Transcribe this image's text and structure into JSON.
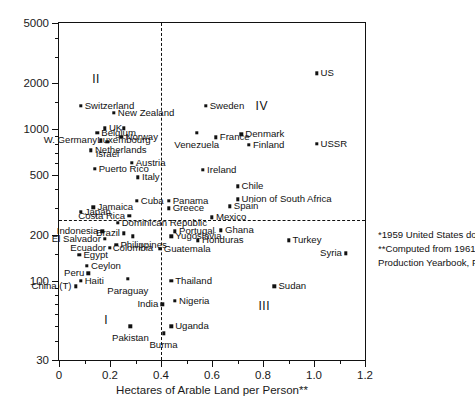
{
  "chart_data": {
    "type": "scatter",
    "title": "",
    "xlabel": "Hectares of Arable Land per Person**",
    "ylabel": "Income per Person*",
    "xlim": [
      0,
      1.2
    ],
    "ylim": [
      30,
      5000
    ],
    "yscale": "log",
    "xscale": "linear",
    "grid": false,
    "legend": null,
    "xticks": [
      "0",
      "0.2",
      "0.4",
      "0.6",
      "0.8",
      "1.0",
      "1.2"
    ],
    "xtick_values": [
      0,
      0.2,
      0.4,
      0.6,
      0.8,
      1.0,
      1.2
    ],
    "yticks": [
      "5000",
      "2000",
      "1000",
      "500",
      "200",
      "100",
      "30"
    ],
    "ytick_values": [
      5000,
      2000,
      1000,
      500,
      200,
      100,
      30
    ],
    "reference_lines": [
      {
        "orientation": "vertical",
        "value": 0.4,
        "style": "dashed"
      },
      {
        "orientation": "horizontal",
        "value": 250,
        "style": "dashed"
      }
    ],
    "quadrant_labels": [
      {
        "label": "I",
        "x": 0.185,
        "y": 55
      },
      {
        "label": "II",
        "x": 0.145,
        "y": 2150
      },
      {
        "label": "III",
        "x": 0.805,
        "y": 68
      },
      {
        "label": "IV",
        "x": 0.795,
        "y": 1420
      }
    ],
    "annotations": [
      "*1959 United States dollars",
      "**Computed from 1961",
      "Production Yearbook, FAO"
    ],
    "points": [
      {
        "name": "US",
        "x": 1.01,
        "y": 2330,
        "side": "r"
      },
      {
        "name": "USSR",
        "x": 1.01,
        "y": 800,
        "side": "r"
      },
      {
        "name": "Switzerland",
        "x": 0.085,
        "y": 1420,
        "side": "r"
      },
      {
        "name": "New Zealand",
        "x": 0.215,
        "y": 1275,
        "side": "r"
      },
      {
        "name": "Sweden",
        "x": 0.575,
        "y": 1420,
        "side": "r"
      },
      {
        "name": "UK",
        "x": 0.18,
        "y": 1010,
        "side": "r"
      },
      {
        "name": "Luxembourg",
        "x": 0.255,
        "y": 1010,
        "side": "cb"
      },
      {
        "name": "Belgium",
        "x": 0.15,
        "y": 940,
        "side": "r"
      },
      {
        "name": "Venezuela",
        "x": 0.54,
        "y": 940,
        "side": "cb"
      },
      {
        "name": "Denmark",
        "x": 0.715,
        "y": 925,
        "side": "r"
      },
      {
        "name": "Norway",
        "x": 0.245,
        "y": 885,
        "side": "r"
      },
      {
        "name": "W. Germany",
        "x": 0.165,
        "y": 845,
        "side": "l"
      },
      {
        "name": "France",
        "x": 0.615,
        "y": 880,
        "side": "r"
      },
      {
        "name": "Israel",
        "x": 0.19,
        "y": 820,
        "side": "cb"
      },
      {
        "name": "Finland",
        "x": 0.745,
        "y": 790,
        "side": "r"
      },
      {
        "name": "Netherlands",
        "x": 0.125,
        "y": 725,
        "side": "r"
      },
      {
        "name": "Austria",
        "x": 0.285,
        "y": 600,
        "side": "r"
      },
      {
        "name": "Puerto Rico",
        "x": 0.14,
        "y": 545,
        "side": "r"
      },
      {
        "name": "Ireland",
        "x": 0.565,
        "y": 540,
        "side": "r"
      },
      {
        "name": "Italy",
        "x": 0.31,
        "y": 480,
        "side": "r"
      },
      {
        "name": "Chile",
        "x": 0.7,
        "y": 420,
        "side": "r"
      },
      {
        "name": "Union of South Africa",
        "x": 0.7,
        "y": 345,
        "side": "r"
      },
      {
        "name": "Cuba",
        "x": 0.305,
        "y": 335,
        "side": "r"
      },
      {
        "name": "Panama",
        "x": 0.43,
        "y": 335,
        "side": "r"
      },
      {
        "name": "Spain",
        "x": 0.67,
        "y": 310,
        "side": "r"
      },
      {
        "name": "Jamaica",
        "x": 0.135,
        "y": 305,
        "side": "r"
      },
      {
        "name": "Greece",
        "x": 0.43,
        "y": 300,
        "side": "r"
      },
      {
        "name": "Japan",
        "x": 0.085,
        "y": 285,
        "side": "r"
      },
      {
        "name": "Costa Rica",
        "x": 0.275,
        "y": 268,
        "side": "l"
      },
      {
        "name": "Mexico",
        "x": 0.6,
        "y": 262,
        "side": "r"
      },
      {
        "name": "Dominican Republic",
        "x": 0.23,
        "y": 240,
        "side": "r"
      },
      {
        "name": "Indonesia",
        "x": 0.17,
        "y": 212,
        "side": "l"
      },
      {
        "name": "Brazil",
        "x": 0.255,
        "y": 205,
        "side": "l"
      },
      {
        "name": "Portugal",
        "x": 0.455,
        "y": 212,
        "side": "r"
      },
      {
        "name": "Colombia",
        "x": 0.29,
        "y": 196,
        "side": "cb"
      },
      {
        "name": "Yugoslavia",
        "x": 0.44,
        "y": 196,
        "side": "r"
      },
      {
        "name": "El Salvador",
        "x": 0.18,
        "y": 188,
        "side": "l"
      },
      {
        "name": "Honduras",
        "x": 0.545,
        "y": 185,
        "side": "r"
      },
      {
        "name": "Philippines",
        "x": 0.225,
        "y": 172,
        "side": "r"
      },
      {
        "name": "Ecuador",
        "x": 0.2,
        "y": 165,
        "side": "l"
      },
      {
        "name": "Guatemala",
        "x": 0.395,
        "y": 162,
        "side": "r"
      },
      {
        "name": "Egypt",
        "x": 0.08,
        "y": 148,
        "side": "r"
      },
      {
        "name": "Ceylon",
        "x": 0.11,
        "y": 125,
        "side": "r"
      },
      {
        "name": "Peru",
        "x": 0.115,
        "y": 112,
        "side": "l"
      },
      {
        "name": "Haiti",
        "x": 0.085,
        "y": 100,
        "side": "r"
      },
      {
        "name": "Paraguay",
        "x": 0.27,
        "y": 103,
        "side": "cb"
      },
      {
        "name": "Thailand",
        "x": 0.44,
        "y": 100,
        "side": "r"
      },
      {
        "name": "China (T)",
        "x": 0.065,
        "y": 92,
        "side": "l"
      },
      {
        "name": "Sudan",
        "x": 0.845,
        "y": 92,
        "side": "r"
      },
      {
        "name": "Nigeria",
        "x": 0.455,
        "y": 74,
        "side": "r"
      },
      {
        "name": "India",
        "x": 0.405,
        "y": 70,
        "side": "l"
      },
      {
        "name": "Ghana",
        "x": 0.635,
        "y": 215,
        "side": "r"
      },
      {
        "name": "Turkey",
        "x": 0.9,
        "y": 185,
        "side": "r"
      },
      {
        "name": "Syria",
        "x": 1.125,
        "y": 152,
        "side": "l"
      },
      {
        "name": "Pakistan",
        "x": 0.28,
        "y": 50,
        "side": "cb"
      },
      {
        "name": "Uganda",
        "x": 0.44,
        "y": 50,
        "side": "r"
      },
      {
        "name": "Burma",
        "x": 0.41,
        "y": 45,
        "side": "cb"
      }
    ]
  }
}
